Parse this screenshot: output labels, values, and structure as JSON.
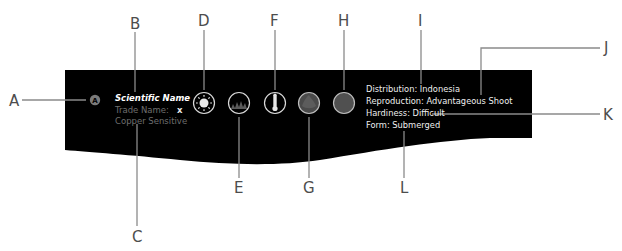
{
  "panel": {
    "background": "#000000",
    "badge": {
      "letter": "A",
      "color": "#7a7a7a"
    },
    "names": {
      "scientific_name": "Scientific Name",
      "trade_name_label": "Trade Name:",
      "trade_name_value": "x",
      "copper_sensitive": "Copper Sensitive"
    },
    "icons": [
      {
        "id": "D",
        "name": "light-sun-icon"
      },
      {
        "id": "E",
        "name": "growth-grass-icon"
      },
      {
        "id": "F",
        "name": "temperature-thermometer-icon"
      },
      {
        "id": "G",
        "name": "textured-swatch-icon"
      },
      {
        "id": "H",
        "name": "solid-swatch-icon"
      }
    ],
    "info": {
      "distribution": "Distribution: Indonesia",
      "reproduction": "Reproduction: Advantageous Shoot",
      "hardiness": "Hardiness: Difficult",
      "form": "Form: Submerged"
    }
  },
  "callouts": {
    "A": "A",
    "B": "B",
    "C": "C",
    "D": "D",
    "E": "E",
    "F": "F",
    "G": "G",
    "H": "H",
    "I": "I",
    "J": "J",
    "K": "K",
    "L": "L"
  }
}
